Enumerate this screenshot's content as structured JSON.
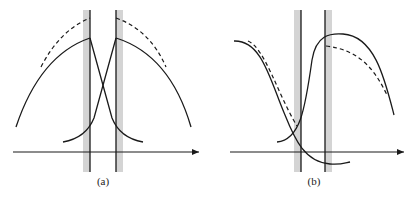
{
  "figure": {
    "panels": [
      {
        "id": "a",
        "label": "(a)"
      },
      {
        "id": "b",
        "label": "(b)"
      }
    ],
    "colors": {
      "line": "#1a1a1a",
      "band": "#cfcfcf",
      "background": "#ffffff"
    }
  }
}
